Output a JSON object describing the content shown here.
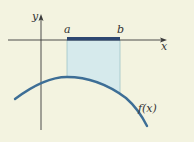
{
  "diagram": {
    "labels": {
      "y_axis": "y",
      "x_axis": "x",
      "a": "a",
      "b": "b",
      "function": "f(x)"
    },
    "colors": {
      "background": "#f3f3e0",
      "axis": "#3a3a3a",
      "interval_bar": "#2d4770",
      "curve": "#3d6e96",
      "shaded_region": "#d6eaec",
      "shade_edge": "#9fc4c8"
    }
  }
}
